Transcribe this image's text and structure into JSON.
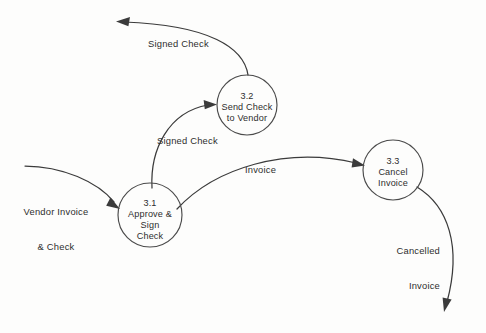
{
  "diagram": {
    "type": "data-flow-diagram",
    "stroke_color": "#3b3b3b",
    "background_color": "#fdfdfc",
    "processes": [
      {
        "id": "3.1",
        "number": "3.1",
        "name_lines": [
          "Approve &",
          "Sign",
          "Check"
        ],
        "line1": "3.1",
        "line2": "Approve &",
        "line3": "Sign",
        "line4": "Check",
        "cx": 150,
        "cy": 215,
        "r": 32
      },
      {
        "id": "3.2",
        "number": "3.2",
        "name_lines": [
          "Send Check",
          "to Vendor"
        ],
        "line1": "3.2",
        "line2": "Send Check",
        "line3": "to Vendor",
        "cx": 247,
        "cy": 105,
        "r": 30
      },
      {
        "id": "3.3",
        "number": "3.3",
        "name_lines": [
          "Cancel",
          "Invoice"
        ],
        "line1": "3.3",
        "line2": "Cancel",
        "line3": "Invoice",
        "cx": 393,
        "cy": 170,
        "r": 30
      }
    ],
    "flows": [
      {
        "id": "vendor-invoice-check",
        "label_line1": "Vendor Invoice",
        "label_line2": "& Check",
        "from": "external",
        "to": "3.1"
      },
      {
        "id": "signed-check-to-send",
        "label": "Signed Check",
        "from": "3.1",
        "to": "3.2"
      },
      {
        "id": "signed-check-out",
        "label": "Signed Check",
        "from": "3.2",
        "to": "external"
      },
      {
        "id": "invoice",
        "label": "Invoice",
        "from": "3.1",
        "to": "3.3"
      },
      {
        "id": "cancelled-invoice",
        "label_line1": "Cancelled",
        "label_line2": "Invoice",
        "from": "3.3",
        "to": "external"
      }
    ]
  }
}
